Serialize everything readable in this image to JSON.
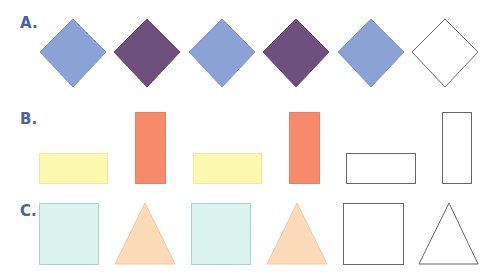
{
  "rows": [
    {
      "label": "A.",
      "pattern": [
        "blue-diamond",
        "purple-diamond",
        "blue-diamond",
        "purple-diamond",
        "blue-diamond",
        "blank-diamond"
      ]
    },
    {
      "label": "B.",
      "pattern": [
        "yellow-horizontal-rectangle",
        "red-vertical-rectangle",
        "yellow-horizontal-rectangle",
        "red-vertical-rectangle",
        "blank-horizontal-rectangle",
        "blank-vertical-rectangle"
      ]
    },
    {
      "label": "C.",
      "pattern": [
        "teal-square",
        "peach-triangle",
        "teal-square",
        "peach-triangle",
        "blank-square",
        "blank-triangle"
      ]
    }
  ],
  "colors": {
    "label": "#4a62a0",
    "blue": "#8aa2d6",
    "purple": "#6e4f7e",
    "yellow": "#fdf8b0",
    "red": "#f88a6c",
    "teal": "#dcf4ee",
    "peach": "#fcdbb8",
    "outline": "#666666"
  }
}
